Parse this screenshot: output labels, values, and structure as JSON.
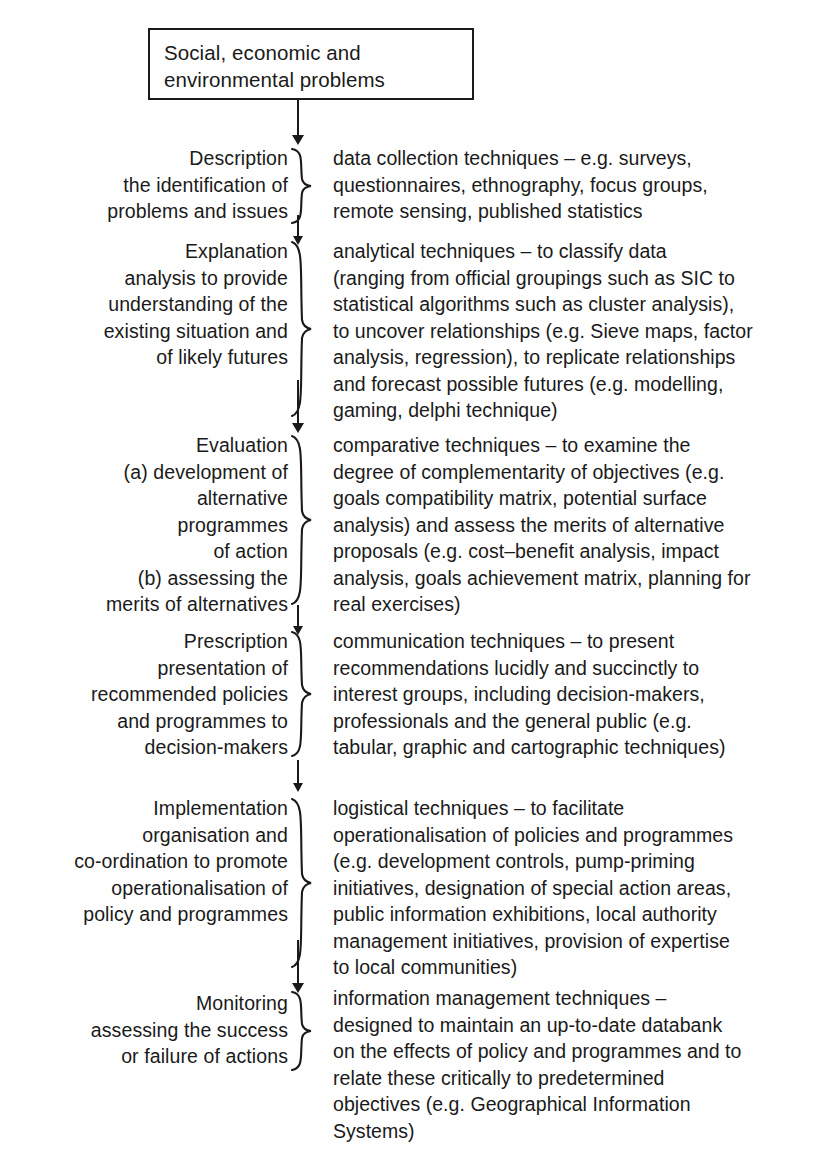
{
  "diagram": {
    "title_box": {
      "lines": [
        "Social, economic and",
        "environmental problems"
      ]
    },
    "stages": [
      {
        "name": "description",
        "left_lines": [
          "Description",
          "the identification of",
          "problems and issues"
        ],
        "right_lines": [
          "data collection techniques – e.g. surveys,",
          "questionnaires, ethnography, focus groups,",
          "remote sensing, published statistics"
        ]
      },
      {
        "name": "explanation",
        "left_lines": [
          "Explanation",
          "analysis to provide",
          "understanding of the",
          "existing situation and",
          "of likely futures"
        ],
        "right_lines": [
          "analytical techniques – to classify data",
          "(ranging from official groupings such as SIC to",
          "statistical algorithms such as cluster analysis),",
          "to uncover relationships (e.g. Sieve maps, factor",
          "analysis, regression), to replicate relationships",
          "and forecast possible futures (e.g. modelling,",
          "gaming, delphi technique)"
        ]
      },
      {
        "name": "evaluation",
        "left_lines": [
          "Evaluation",
          "(a) development of",
          "alternative",
          "programmes",
          "of action",
          "(b) assessing the",
          "merits of alternatives"
        ],
        "right_lines": [
          "comparative techniques – to examine the",
          "degree of complementarity of objectives (e.g.",
          "goals compatibility matrix, potential surface",
          "analysis) and assess the merits of alternative",
          "proposals (e.g. cost–benefit analysis, impact",
          "analysis, goals achievement matrix, planning for",
          "real exercises)"
        ]
      },
      {
        "name": "prescription",
        "left_lines": [
          "Prescription",
          "presentation of",
          "recommended policies",
          "and programmes to",
          "decision-makers"
        ],
        "right_lines": [
          "communication techniques – to present",
          "recommendations lucidly and succinctly to",
          "interest groups, including decision-makers,",
          "professionals and the general public (e.g.",
          "tabular, graphic and cartographic techniques)"
        ]
      },
      {
        "name": "implementation",
        "left_lines": [
          "Implementation",
          "organisation and",
          "co-ordination to promote",
          "operationalisation of",
          "policy and programmes"
        ],
        "right_lines": [
          "logistical techniques – to facilitate",
          "operationalisation of policies and programmes",
          "(e.g. development controls, pump-priming",
          "initiatives, designation of special action areas,",
          "public information exhibitions, local authority",
          "management initiatives, provision of expertise",
          "to local communities)"
        ]
      },
      {
        "name": "monitoring",
        "left_lines": [
          "Monitoring",
          "assessing the success",
          "or failure of actions"
        ],
        "right_lines": [
          "information management techniques –",
          "designed to maintain an up-to-date databank",
          "on the effects of policy and programmes and to",
          "relate these critically to predetermined",
          "objectives (e.g. Geographical Information",
          "Systems)"
        ]
      }
    ],
    "colors": {
      "ink": "#1a1a1a",
      "background": "#ffffff"
    }
  }
}
